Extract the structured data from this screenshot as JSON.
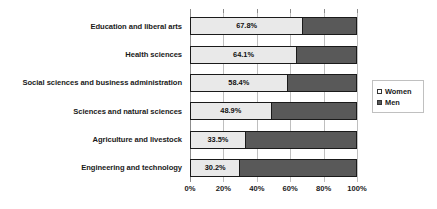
{
  "chart_data": {
    "type": "bar",
    "orientation": "horizontal",
    "stacked": true,
    "normalized": true,
    "title": "",
    "subtitle": "",
    "xlabel": "",
    "ylabel": "",
    "xlim": [
      0,
      100
    ],
    "grid": true,
    "legend_position": "right",
    "categories": [
      "Education and liberal arts",
      "Health sciences",
      "Social sciences and business administration",
      "Sciences and natural sciences",
      "Agriculture and livestock",
      "Engineering and technology"
    ],
    "series": [
      {
        "name": "Women",
        "color": "#e9e9e9",
        "values": [
          67.8,
          64.1,
          58.4,
          48.9,
          33.5,
          30.2
        ],
        "labels": [
          "67.8%",
          "64.1%",
          "58.4%",
          "48.9%",
          "33.5%",
          "30.2%"
        ]
      },
      {
        "name": "Men",
        "color": "#595959",
        "values": [
          32.2,
          35.9,
          41.6,
          51.1,
          66.5,
          69.8
        ],
        "labels": [
          "",
          "",
          "",
          "",
          "",
          ""
        ]
      }
    ],
    "xticks": [
      0,
      20,
      40,
      60,
      80,
      100
    ],
    "xtick_labels": [
      "0%",
      "20%",
      "40%",
      "60%",
      "80%",
      "100%"
    ]
  },
  "legend": {
    "entries": [
      {
        "label": "Women",
        "swatch": "women-swatch-icon"
      },
      {
        "label": "Men",
        "swatch": "men-swatch-icon"
      }
    ]
  },
  "colors": {
    "women": "#e9e9e9",
    "men": "#595959",
    "bar_outline": "#1a1a1a",
    "gridline": "#bfbfbf",
    "axis": "#8c8c8c",
    "text": "#1a1a1a",
    "background": "#ffffff"
  }
}
